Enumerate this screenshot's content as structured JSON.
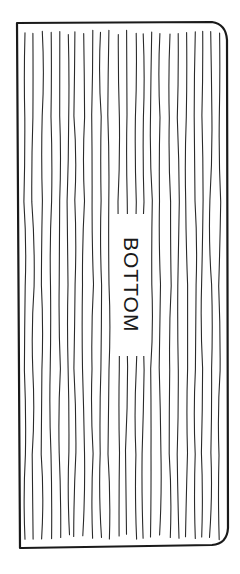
{
  "diagram": {
    "panel_label": "BOTTOM",
    "grain_line_count": 24,
    "grain_direction": "vertical",
    "colors": {
      "outline": "#1a1a1a",
      "grain": "#2a2a2a",
      "background": "#ffffff"
    }
  }
}
